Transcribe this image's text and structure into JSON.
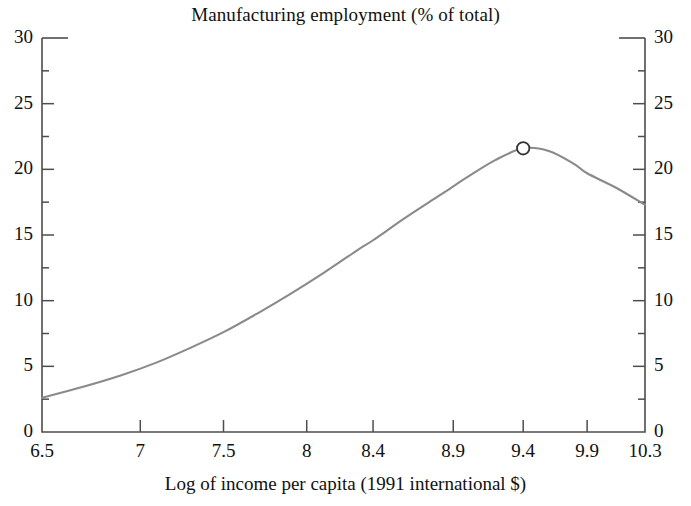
{
  "chart_data": {
    "type": "line",
    "title": "Manufacturing employment (% of total)",
    "xlabel": "Log of income per capita (1991 international $)",
    "ylabel": "",
    "xlim": [
      6.5,
      10.3
    ],
    "ylim": [
      0,
      30
    ],
    "grid": false,
    "legend": null,
    "x_tick_labels": [
      "6.5",
      "7",
      "7.5",
      "8",
      "8.4",
      "8.9",
      "9.4",
      "9.9",
      "10.3"
    ],
    "x_tick_values": [
      6.5,
      7.0,
      7.5,
      8.0,
      8.4,
      8.9,
      9.4,
      9.9,
      10.3
    ],
    "x_tick_positions_frac": [
      0.0,
      0.163,
      0.301,
      0.439,
      0.549,
      0.682,
      0.798,
      0.904,
      1.0
    ],
    "y_tick_labels_left": [
      "30",
      "25",
      "20",
      "15",
      "10",
      "5",
      "0"
    ],
    "y_tick_labels_right": [
      "30",
      "25",
      "20",
      "15",
      "10",
      "5",
      "0"
    ],
    "y_tick_values": [
      30,
      25,
      20,
      15,
      10,
      5,
      0
    ],
    "y_minor_tick_values": [
      27.5,
      22.5,
      17.5,
      12.5,
      7.5,
      2.5
    ],
    "series": [
      {
        "name": "Manufacturing employment share",
        "color": "#8a8a8a",
        "x": [
          6.5,
          6.7,
          6.9,
          7.1,
          7.3,
          7.5,
          7.7,
          7.9,
          8.1,
          8.3,
          8.4,
          8.6,
          8.8,
          8.9,
          9.0,
          9.2,
          9.4,
          9.6,
          9.8,
          9.9,
          10.1,
          10.3
        ],
        "y": [
          2.6,
          3.4,
          4.3,
          5.3,
          6.4,
          7.6,
          9.0,
          10.5,
          12.1,
          13.8,
          14.6,
          16.3,
          17.9,
          18.7,
          19.4,
          20.7,
          21.6,
          21.4,
          20.4,
          19.7,
          18.6,
          17.3
        ]
      }
    ],
    "markers": [
      {
        "name": "peak-marker",
        "shape": "circle-open",
        "x": 9.4,
        "y": 21.6,
        "color": "#333333"
      }
    ]
  },
  "style": {
    "line_color": "#8a8a8a",
    "axis_color": "#4d4d4d",
    "text_color": "#111111",
    "background": "#ffffff"
  }
}
